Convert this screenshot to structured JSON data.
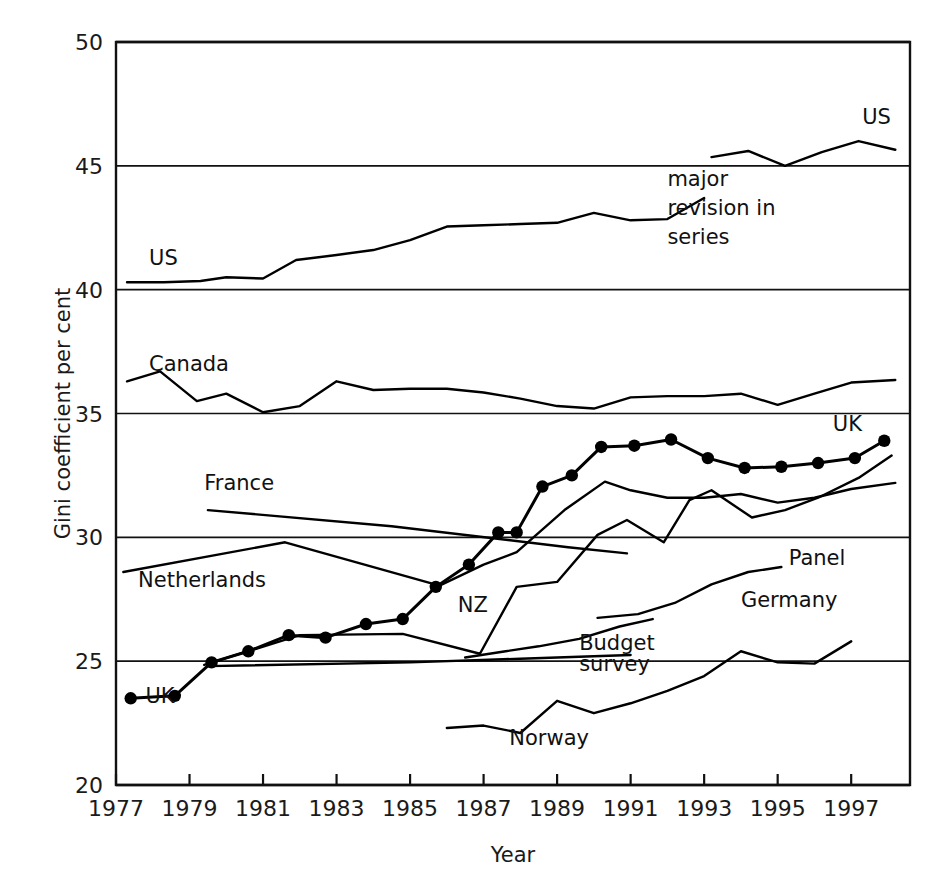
{
  "chart_data": {
    "type": "line",
    "title": "",
    "xlabel": "Year",
    "ylabel": "Gini coefficient per cent",
    "xlim": [
      1977,
      1998.6
    ],
    "ylim": [
      20,
      50
    ],
    "ytick_values": [
      20,
      25,
      30,
      35,
      40,
      45,
      50
    ],
    "ytick_labels": [
      "20",
      "25",
      "30",
      "35",
      "40",
      "45",
      "50"
    ],
    "xtick_values": [
      1977,
      1979,
      1981,
      1983,
      1985,
      1987,
      1989,
      1991,
      1993,
      1995,
      1997
    ],
    "xtick_labels": [
      "1977",
      "1979",
      "1981",
      "1983",
      "1985",
      "1987",
      "1989",
      "1991",
      "1993",
      "1995",
      "1997"
    ],
    "grid": "horizontal-gridlines-at-yticks",
    "legend": "inline-series-labels",
    "markers": "filled-circles-on-uk-series-only",
    "line_color": "#000000",
    "background_color": "#ffffff",
    "annotations": [
      {
        "name": "major-revision-note",
        "text_lines": [
          "major",
          "revision in",
          "series"
        ],
        "x": 1992.0,
        "y": 44.2
      }
    ],
    "series": [
      {
        "name": "US",
        "label": "US",
        "label_x": 1977.9,
        "label_y": 41.0,
        "markers": false,
        "x": [
          1977.3,
          1978.3,
          1979.3,
          1980.0,
          1981.0,
          1981.9,
          1983.0,
          1984.0,
          1985.0,
          1986.0,
          1987.0,
          1988.0,
          1989.0,
          1990.0,
          1991.0,
          1992.0,
          1993.0
        ],
        "y": [
          40.3,
          40.3,
          40.35,
          40.5,
          40.45,
          41.2,
          41.4,
          41.6,
          42.0,
          42.55,
          42.6,
          42.65,
          42.7,
          43.1,
          42.8,
          42.85,
          43.7
        ]
      },
      {
        "name": "US-revised",
        "label": "US",
        "label_x": 1997.3,
        "label_y": 46.7,
        "markers": false,
        "x": [
          1993.2,
          1994.2,
          1995.2,
          1996.2,
          1997.2,
          1998.2
        ],
        "y": [
          45.35,
          45.6,
          45.0,
          45.55,
          46.0,
          45.65
        ]
      },
      {
        "name": "Canada",
        "label": "Canada",
        "label_x": 1977.9,
        "label_y": 36.7,
        "markers": false,
        "x": [
          1977.3,
          1978.2,
          1979.2,
          1980.0,
          1981.0,
          1982.0,
          1983.0,
          1984.0,
          1985.0,
          1986.0,
          1987.0,
          1988.0,
          1989.0,
          1990.0,
          1991.0,
          1992.0,
          1993.0,
          1994.0,
          1995.0,
          1996.0,
          1997.0,
          1998.2
        ],
        "y": [
          36.3,
          36.7,
          35.5,
          35.8,
          35.05,
          35.3,
          36.3,
          35.95,
          36.0,
          36.0,
          35.85,
          35.6,
          35.3,
          35.2,
          35.65,
          35.7,
          35.7,
          35.8,
          35.35,
          35.8,
          36.25,
          36.35
        ]
      },
      {
        "name": "UK",
        "label": "UK",
        "label_x": 1977.8,
        "label_y": 23.3,
        "label2": "UK",
        "label2_x": 1996.5,
        "label2_y": 34.3,
        "markers": true,
        "x": [
          1977.4,
          1978.6,
          1979.6,
          1980.6,
          1981.7,
          1982.7,
          1983.8,
          1984.8,
          1985.7,
          1986.6,
          1987.4,
          1987.9,
          1988.6,
          1989.4,
          1990.2,
          1991.1,
          1992.1,
          1993.1,
          1994.1,
          1995.1,
          1996.1,
          1997.1,
          1997.9
        ],
        "y": [
          23.5,
          23.6,
          24.95,
          25.4,
          26.05,
          25.95,
          26.5,
          26.7,
          28.0,
          28.9,
          30.2,
          30.2,
          32.05,
          32.5,
          33.65,
          33.7,
          33.95,
          33.2,
          32.8,
          32.85,
          33.0,
          33.2,
          33.9
        ]
      },
      {
        "name": "France",
        "label": "France",
        "label_x": 1979.4,
        "label_y": 31.9,
        "markers": false,
        "x": [
          1979.5,
          1984.5,
          1989.3,
          1990.9
        ],
        "y": [
          31.1,
          30.45,
          29.6,
          29.35
        ]
      },
      {
        "name": "Netherlands",
        "label": "Netherlands",
        "label_x": 1977.6,
        "label_y": 28.0,
        "markers": false,
        "x": [
          1977.2,
          1981.6,
          1985.8,
          1987.0,
          1987.9,
          1989.2,
          1990.3,
          1991.0,
          1992.0,
          1993.0,
          1994.0,
          1995.0,
          1996.0,
          1997.0,
          1998.2
        ],
        "y": [
          28.6,
          29.8,
          28.05,
          28.9,
          29.4,
          31.1,
          32.25,
          31.9,
          31.6,
          31.6,
          31.75,
          31.4,
          31.6,
          31.95,
          32.2
        ]
      },
      {
        "name": "NZ",
        "label": "NZ",
        "label_x": 1986.3,
        "label_y": 27.0,
        "markers": false,
        "x": [
          1979.4,
          1982.0,
          1984.8,
          1986.9,
          1987.9,
          1989.0,
          1990.1,
          1990.9,
          1991.9,
          1992.6,
          1993.2,
          1994.3,
          1995.2,
          1996.1,
          1997.2,
          1998.1
        ],
        "y": [
          24.85,
          26.05,
          26.1,
          25.3,
          28.0,
          28.2,
          30.1,
          30.7,
          29.8,
          31.5,
          31.9,
          30.8,
          31.1,
          31.6,
          32.4,
          33.3
        ]
      },
      {
        "name": "Germany-Panel",
        "label": "Panel",
        "label_x": 1995.3,
        "label_y": 28.9,
        "markers": false,
        "x": [
          1990.1,
          1991.2,
          1992.2,
          1993.2,
          1994.2,
          1995.1
        ],
        "y": [
          26.75,
          26.9,
          27.35,
          28.1,
          28.6,
          28.8
        ]
      },
      {
        "name": "Germany-Budget-survey",
        "label": "Germany",
        "label_x": 1994.0,
        "label_y": 27.2,
        "markers": false,
        "x": [
          1986.5,
          1987.6,
          1988.5,
          1989.6,
          1990.7,
          1991.6
        ],
        "y": [
          25.15,
          25.4,
          25.6,
          25.9,
          26.4,
          26.7
        ]
      },
      {
        "name": "Budget-survey-flat",
        "label": "Budget",
        "label_x": 1989.6,
        "label_y": 25.45,
        "label2": "survey",
        "label2_x": 1989.6,
        "label2_y": 24.6,
        "markers": false,
        "x": [
          1979.5,
          1985.0,
          1988.0,
          1991.0
        ],
        "y": [
          24.8,
          24.95,
          25.1,
          25.25
        ]
      },
      {
        "name": "Norway",
        "label": "Norway",
        "label_x": 1987.7,
        "label_y": 21.6,
        "markers": false,
        "x": [
          1986.0,
          1987.0,
          1988.0,
          1989.0,
          1990.0,
          1991.0,
          1992.0,
          1993.0,
          1994.0,
          1995.0,
          1996.0,
          1997.0
        ],
        "y": [
          22.3,
          22.4,
          22.1,
          23.4,
          22.9,
          23.3,
          23.8,
          24.4,
          25.4,
          24.95,
          24.9,
          25.8
        ]
      }
    ]
  }
}
